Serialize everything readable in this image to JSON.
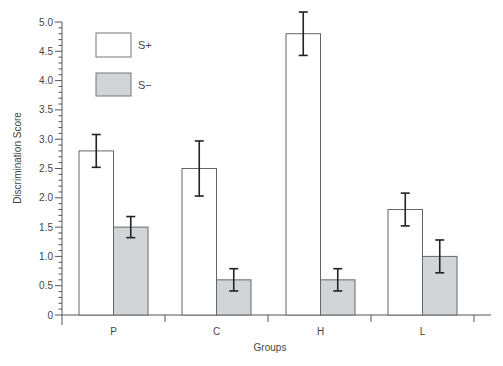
{
  "chart_data": {
    "type": "bar",
    "title": "",
    "xlabel": "Groups",
    "ylabel": "Discrimination Score",
    "categories": [
      "P",
      "C",
      "H",
      "L"
    ],
    "ylim": [
      0,
      5.0
    ],
    "yticks": [
      "0",
      "0.5",
      "1.0",
      "1.5",
      "2.0",
      "2.5",
      "3.0",
      "3.5",
      "4.0",
      "4.5",
      "5.0"
    ],
    "ytick_values": [
      0,
      0.5,
      1.0,
      1.5,
      2.0,
      2.5,
      3.0,
      3.5,
      4.0,
      4.5,
      5.0
    ],
    "minor_tick_step": 0.1,
    "grid": false,
    "legend_position": "upper-left",
    "series": [
      {
        "name": "S+",
        "fill": "#ffffff",
        "values": [
          2.8,
          2.5,
          4.8,
          1.8
        ],
        "error": [
          0.28,
          0.47,
          0.37,
          0.28
        ]
      },
      {
        "name": "S−",
        "fill": "#d2d5d8",
        "values": [
          1.5,
          0.6,
          0.6,
          1.0
        ],
        "error": [
          0.18,
          0.19,
          0.19,
          0.28
        ]
      }
    ]
  },
  "legend": {
    "items": [
      {
        "label": "S+",
        "fill": "#ffffff"
      },
      {
        "label": "S−",
        "fill": "#d2d5d8"
      }
    ]
  },
  "colors": {
    "axis": "#555555",
    "bar_outline": "#666666",
    "error_bar": "#222222",
    "gray_fill": "#d2d5d8"
  }
}
